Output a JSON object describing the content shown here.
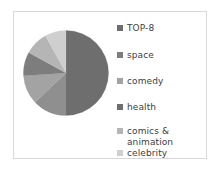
{
  "chart_data": {
    "type": "pie",
    "title": "",
    "legend_position": "right",
    "categories": [
      "TOP-8",
      "space",
      "comedy",
      "health",
      "comics & animation",
      "celebrity"
    ],
    "values": [
      50,
      13,
      11,
      9,
      9,
      8
    ],
    "colors": [
      "#6e6e6e",
      "#8f8f8f",
      "#a3a3a3",
      "#7d7d7d",
      "#b5b5b5",
      "#cfcfcf"
    ],
    "start_angle_deg": 0,
    "direction": "clockwise",
    "slices": [
      {
        "label": "TOP-8",
        "value": 50,
        "color": "#6e6e6e"
      },
      {
        "label": "space",
        "value": 13,
        "color": "#8f8f8f"
      },
      {
        "label": "comedy",
        "value": 11,
        "color": "#a3a3a3"
      },
      {
        "label": "health",
        "value": 9,
        "color": "#7d7d7d"
      },
      {
        "label": "comics & animation",
        "value": 9,
        "color": "#b5b5b5"
      },
      {
        "label": "celebrity",
        "value": 8,
        "color": "#cfcfcf"
      }
    ]
  },
  "legend": {
    "items": [
      {
        "label": "TOP-8",
        "color": "#6e6e6e",
        "top": 9
      },
      {
        "label": "space",
        "color": "#7d7d7d",
        "top": 36
      },
      {
        "label": "comedy",
        "color": "#a3a3a3",
        "top": 62
      },
      {
        "label": "health",
        "color": "#6e6e6e",
        "top": 88
      },
      {
        "label": "comics & animation",
        "color": "#b5b5b5",
        "top": 112
      },
      {
        "label": "celebrity",
        "color": "#cfcfcf",
        "top": 134
      }
    ]
  },
  "frame": {
    "border_color": "#d9d9d9",
    "background_color": "#ffffff"
  }
}
